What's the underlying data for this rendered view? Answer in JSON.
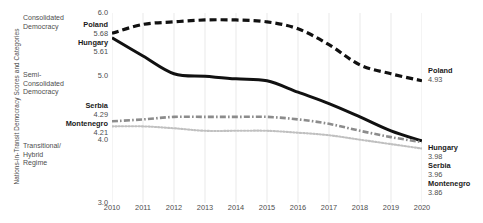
{
  "chart_data": {
    "type": "line",
    "title": "",
    "xlabel": "",
    "ylabel": "Nations-in-Transit Democracy Scores and Categories",
    "x": [
      2010,
      2011,
      2012,
      2013,
      2014,
      2015,
      2016,
      2017,
      2018,
      2019,
      2020
    ],
    "xlim": [
      2010,
      2020
    ],
    "ylim": [
      3.0,
      6.0
    ],
    "yticks": [
      "6.0",
      "5.0",
      "4.0",
      "3.0"
    ],
    "ytick_values": [
      6.0,
      5.0,
      4.0,
      3.0
    ],
    "xticks": [
      "2010",
      "2011",
      "2012",
      "2013",
      "2014",
      "2015",
      "2016",
      "2017",
      "2018",
      "2019",
      "2020"
    ],
    "grid": "vertical-only",
    "legend": "inline-endpoint-labels",
    "series": [
      {
        "name": "Poland",
        "style": "dashed",
        "color": "#111111",
        "start_value": 5.68,
        "end_value": 4.93,
        "values": [
          5.68,
          5.82,
          5.86,
          5.89,
          5.89,
          5.86,
          5.75,
          5.5,
          5.18,
          5.04,
          4.93
        ]
      },
      {
        "name": "Hungary",
        "style": "solid",
        "color": "#111111",
        "start_value": 5.61,
        "end_value": 3.98,
        "values": [
          5.61,
          5.32,
          5.04,
          5.0,
          4.96,
          4.93,
          4.75,
          4.57,
          4.36,
          4.14,
          3.98
        ]
      },
      {
        "name": "Serbia",
        "style": "dash-dot",
        "color": "#8c8c8c",
        "start_value": 4.29,
        "end_value": 3.96,
        "values": [
          4.29,
          4.32,
          4.36,
          4.36,
          4.36,
          4.36,
          4.32,
          4.25,
          4.14,
          4.04,
          3.96
        ]
      },
      {
        "name": "Montenegro",
        "style": "dotted",
        "color": "#c0c0c0",
        "start_value": 4.21,
        "end_value": 3.86,
        "values": [
          4.21,
          4.21,
          4.18,
          4.14,
          4.14,
          4.14,
          4.11,
          4.07,
          4.0,
          3.93,
          3.86
        ]
      }
    ],
    "category_bands": [
      {
        "label": "Consolidated\nDemocracy",
        "range": [
          5.0,
          6.0
        ]
      },
      {
        "label": "Semi-\nConsolidated\nDemocracy",
        "range": [
          4.0,
          5.0
        ]
      },
      {
        "label": "Transitional/\nHybrid\nRegime",
        "range": [
          3.0,
          4.0
        ]
      }
    ],
    "left_labels": [
      {
        "name": "Poland",
        "value": "5.68"
      },
      {
        "name": "Hungary",
        "value": "5.61"
      },
      {
        "name": "Serbia",
        "value": "4.29"
      },
      {
        "name": "Montenegro",
        "value": "4.21"
      }
    ],
    "right_labels": [
      {
        "name": "Poland",
        "value": "4.93"
      },
      {
        "name": "Hungary",
        "value": "3.98"
      },
      {
        "name": "Serbia",
        "value": "3.96"
      },
      {
        "name": "Montenegro",
        "value": "3.86"
      }
    ]
  },
  "categories": {
    "consolidated": "Consolidated\nDemocracy",
    "semi": "Semi-\nConsolidated\nDemocracy",
    "transitional": "Transitional/\nHybrid\nRegime"
  },
  "axis": {
    "y_title": "Nations-in-Transit Democracy Scores and Categories"
  }
}
